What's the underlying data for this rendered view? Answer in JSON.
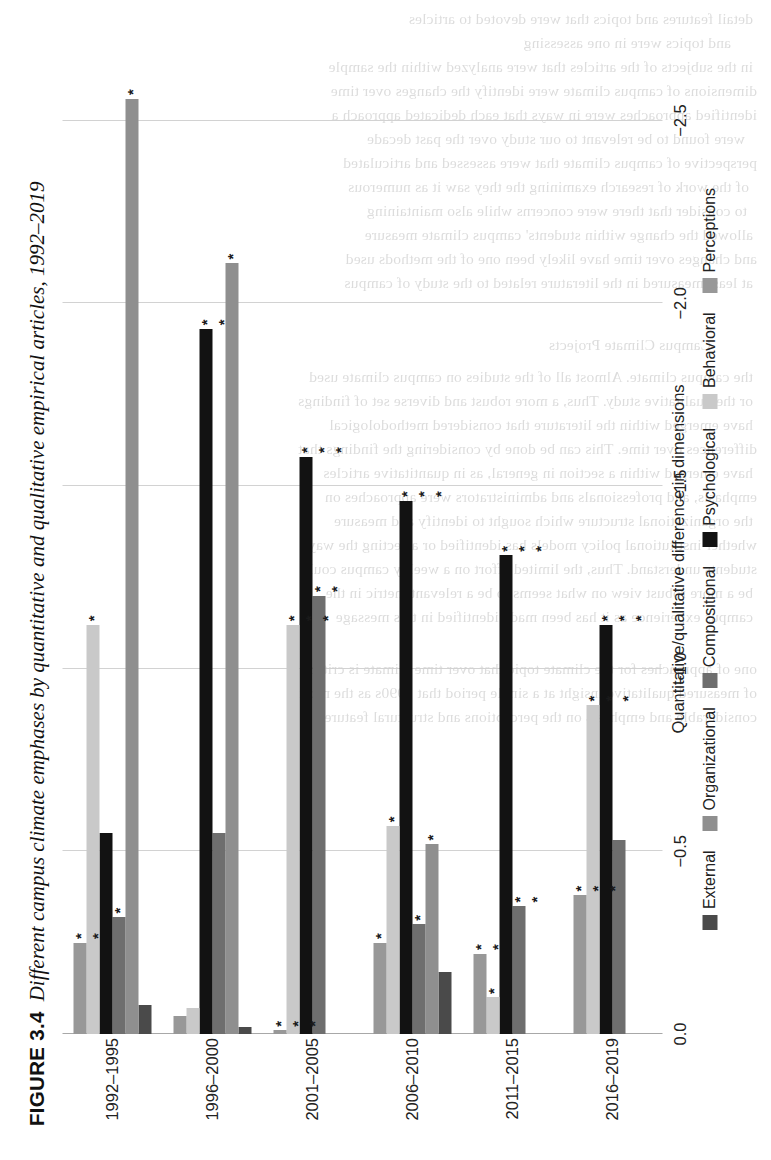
{
  "figure": {
    "number": "FIGURE 3.4",
    "caption": "Different campus climate emphases by quantitative and qualitative empirical articles, 1992–2019"
  },
  "chart_data": {
    "type": "bar",
    "orientation": "horizontal",
    "title": "Different campus climate emphases by quantitative and qualitative empirical articles, 1992–2019",
    "xlabel": "",
    "ylabel": "Quantitative/qualitative difference in dimensions",
    "ylim": [
      0.0,
      -2.6
    ],
    "grid": true,
    "legend_position": "bottom",
    "tick_labels": [
      "0.0",
      "−0.5",
      "−1.0",
      "−1.5",
      "−2.0",
      "−2.5"
    ],
    "tick_values": [
      0.0,
      -0.5,
      -1.0,
      -1.5,
      -2.0,
      -2.5
    ],
    "categories": [
      "1992–1995",
      "1996–2000",
      "2001–2005",
      "2006–2010",
      "2011–2015",
      "2016–2019"
    ],
    "series": [
      {
        "name": "External",
        "color": "#4a4a4a",
        "values": [
          -0.08,
          -0.02,
          0.0,
          -0.17,
          0.0,
          0.0
        ],
        "significance": [
          "",
          "",
          "",
          "",
          "",
          ""
        ]
      },
      {
        "name": "Organizational",
        "color": "#8f8f8f",
        "values": [
          -2.56,
          -2.11,
          0.0,
          -0.52,
          0.0,
          0.0
        ],
        "significance": [
          "*",
          "*",
          "",
          "*",
          "",
          ""
        ]
      },
      {
        "name": "Compositional",
        "color": "#6e6e6e",
        "values": [
          -0.32,
          -0.55,
          -1.2,
          -0.3,
          -0.35,
          -0.53
        ],
        "significance": [
          "*",
          "",
          "**",
          "*",
          "**",
          ""
        ]
      },
      {
        "name": "Psychological",
        "color": "#121212",
        "values": [
          -0.55,
          -1.93,
          -1.58,
          -1.46,
          -1.31,
          -1.12
        ],
        "significance": [
          "",
          "**",
          "***",
          "***",
          "***",
          "***"
        ]
      },
      {
        "name": "Behavioral",
        "color": "#c9c9c9",
        "values": [
          -1.12,
          -0.07,
          -1.12,
          -0.57,
          -0.1,
          -0.9
        ],
        "significance": [
          "*",
          "",
          "***",
          "*",
          "*",
          "***"
        ]
      },
      {
        "name": "Perceptions",
        "color": "#989898",
        "values": [
          -0.25,
          -0.05,
          -0.01,
          -0.25,
          -0.22,
          -0.38
        ],
        "significance": [
          "**",
          "",
          "***",
          "*",
          "**",
          "***"
        ]
      }
    ]
  },
  "bleed_text": [
    {
      "t": "detail    features and topics that were devoted to articles",
      "x": 18,
      "y": 10
    },
    {
      "t": "and topics were in one assessing",
      "x": 40,
      "y": 34
    },
    {
      "t": "in the subjects of the articles that were analyzed within the sample",
      "x": 18,
      "y": 58
    },
    {
      "t": "dimensions of campus climate were identify the changes over time",
      "x": 14,
      "y": 82
    },
    {
      "t": "identified approaches were in ways that each dedicated approach a",
      "x": 14,
      "y": 106
    },
    {
      "t": "were found to be relevant to our study over the past decade",
      "x": 26,
      "y": 130
    },
    {
      "t": "perspective of campus climate that were assessed and articulated",
      "x": 14,
      "y": 154
    },
    {
      "t": "of the work of research examining the they saw it as numerous",
      "x": 22,
      "y": 178
    },
    {
      "t": "to consider that there were concerns while also maintaining",
      "x": 24,
      "y": 202
    },
    {
      "t": "allowed the change within students' campus climate measure",
      "x": 18,
      "y": 226
    },
    {
      "t": "and changes over time have likely been one of the methods used",
      "x": 14,
      "y": 250
    },
    {
      "t": "at least measured in the literature related to the study of campus",
      "x": 18,
      "y": 274
    },
    {
      "t": "Campus Climate Projects",
      "x": 60,
      "y": 336
    },
    {
      "t": "the campus climate. Almost all of the studies on campus climate used",
      "x": 18,
      "y": 368
    },
    {
      "t": "or the qualitative study. Thus, a more robust and diverse set of findings",
      "x": 18,
      "y": 392
    },
    {
      "t": "have emerged within the literature that considered methodological",
      "x": 18,
      "y": 416
    },
    {
      "t": "differences over time. This can be done by considering the findings that",
      "x": 14,
      "y": 440
    },
    {
      "t": "have emerged within a section in general, as in quantitative articles",
      "x": 18,
      "y": 464
    },
    {
      "t": "emphasis, and professionals and administrators were approaches on",
      "x": 14,
      "y": 488
    },
    {
      "t": "the organizational structure which sought to identify and measure",
      "x": 18,
      "y": 512
    },
    {
      "t": "whether institutional policy models has identified or affecting the way",
      "x": 14,
      "y": 536
    },
    {
      "t": "students understand. Thus, the limited effort on a weekly campus could",
      "x": 14,
      "y": 560
    },
    {
      "t": "be a more robust view on what seems to be a relevant metric in the",
      "x": 18,
      "y": 584
    },
    {
      "t": "campus experience as it has been made identified in this message",
      "x": 18,
      "y": 608
    },
    {
      "t": "one of approaches for the climate topic that over time climate is critical",
      "x": 14,
      "y": 660
    },
    {
      "t": "of measured qualitative insight at a single period that 1990s as the most",
      "x": 14,
      "y": 684
    },
    {
      "t": "considerable and emphasis on the perceptions and structural features",
      "x": 14,
      "y": 708
    }
  ]
}
